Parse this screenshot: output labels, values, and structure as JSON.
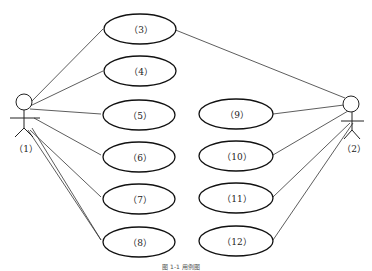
{
  "diagram": {
    "type": "use-case",
    "actors": [
      {
        "id": "actor-1",
        "label": "（1）"
      },
      {
        "id": "actor-2",
        "label": "（2）"
      }
    ],
    "use_cases": [
      {
        "id": "uc3",
        "label": "（3）"
      },
      {
        "id": "uc4",
        "label": "（4）"
      },
      {
        "id": "uc5",
        "label": "（5）"
      },
      {
        "id": "uc6",
        "label": "（6）"
      },
      {
        "id": "uc7",
        "label": "（7）"
      },
      {
        "id": "uc8",
        "label": "（8）"
      },
      {
        "id": "uc9",
        "label": "（9）"
      },
      {
        "id": "uc10",
        "label": "（10）"
      },
      {
        "id": "uc11",
        "label": "（11）"
      },
      {
        "id": "uc12",
        "label": "（12）"
      }
    ],
    "associations": [
      [
        "actor-1",
        "uc3"
      ],
      [
        "actor-1",
        "uc4"
      ],
      [
        "actor-1",
        "uc5"
      ],
      [
        "actor-1",
        "uc6"
      ],
      [
        "actor-1",
        "uc7"
      ],
      [
        "actor-1",
        "uc8"
      ],
      [
        "actor-2",
        "uc3"
      ],
      [
        "actor-2",
        "uc9"
      ],
      [
        "actor-2",
        "uc10"
      ],
      [
        "actor-2",
        "uc11"
      ],
      [
        "actor-2",
        "uc12"
      ]
    ],
    "caption": "图 1-1   用例图"
  }
}
